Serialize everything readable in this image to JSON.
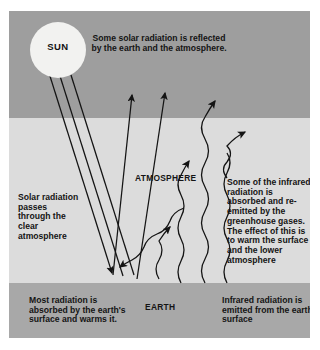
{
  "diagram": {
    "layers": {
      "space_label": "",
      "atmosphere_label": "ATMOSPHERE",
      "earth_label": "EARTH"
    },
    "colors": {
      "space_band": "#9e9e9e",
      "atmosphere_band": "#dcdcdc",
      "earth_band": "#a8a8a8",
      "sun_fill": "#f2f2f0",
      "stroke": "#141414",
      "page_background": "#ffffff"
    },
    "sun": {
      "label": "SUN"
    },
    "annotations": {
      "top": "Some solar radiation is reflected by the earth and the atmosphere.",
      "left": "Solar radiation passes through the clear atmosphere",
      "right": "Some of the infrared radiation is absorbed and re-emitted by the greenhouse gases. The effect of this is to warm the surface and the lower atmosphere",
      "bottom_left": "Most radiation is absorbed by the earth's surface and warms it.",
      "bottom_right": "Infrared radiation is emitted from the earth's surface"
    },
    "arrows": {
      "incoming_solar": "3 straight rays from sun down to earth surface",
      "reflected_solar": "2 straight arrows up through atmosphere to space",
      "reflected_atmosphere": "1 wavy arrow up to space",
      "infrared_emitted": "3 wavy arrows rising from earth surface",
      "re_emitted_down": "1 wavy arrow re-emitted down toward surface",
      "re_emitted_up": "1 wavy arrow re-emitted up into atmosphere"
    }
  }
}
